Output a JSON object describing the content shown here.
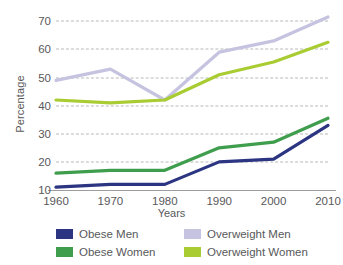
{
  "chart_data": {
    "type": "line",
    "title": "",
    "xlabel": "Years",
    "ylabel": "Percentage",
    "x": [
      1960,
      1970,
      1980,
      1990,
      2000,
      2010
    ],
    "categories": [
      "1960",
      "1970",
      "1980",
      "1990",
      "2000",
      "2010"
    ],
    "yticks": [
      10,
      20,
      30,
      40,
      50,
      60,
      70
    ],
    "ylim": [
      10,
      74
    ],
    "xlim": [
      1960,
      2010
    ],
    "grid": "horizontal-dashed",
    "legend_position": "bottom",
    "series": [
      {
        "name": "Obese Men",
        "color": "#2b3582",
        "values": [
          11,
          12,
          12,
          20,
          21,
          33
        ]
      },
      {
        "name": "Obese Women",
        "color": "#3f9e4d",
        "values": [
          16,
          17,
          17,
          25,
          27,
          35.5
        ]
      },
      {
        "name": "Overweight Men",
        "color": "#c5c3e0",
        "values": [
          49,
          53,
          42,
          59,
          63,
          71.5
        ]
      },
      {
        "name": "Overweight Women",
        "color": "#a8cc32",
        "values": [
          42,
          41,
          42,
          51,
          55.5,
          62.5
        ]
      }
    ]
  },
  "axes": {
    "y_title": "Percentage",
    "x_title": "Years",
    "y_tick_labels": [
      "70",
      "60",
      "50",
      "40",
      "30",
      "20",
      "10"
    ],
    "x_tick_labels": [
      "1960",
      "1970",
      "1980",
      "1990",
      "2000",
      "2010"
    ]
  },
  "legend": {
    "items": [
      {
        "label": "Obese Men",
        "color": "#2b3582"
      },
      {
        "label": "Overweight Men",
        "color": "#c5c3e0"
      },
      {
        "label": "Obese Women",
        "color": "#3f9e4d"
      },
      {
        "label": "Overweight Women",
        "color": "#a8cc32"
      }
    ]
  },
  "colors": {
    "grid": "#b9b9bb",
    "axis": "#9d9d9f",
    "text": "#58585a",
    "background": "#ffffff"
  }
}
